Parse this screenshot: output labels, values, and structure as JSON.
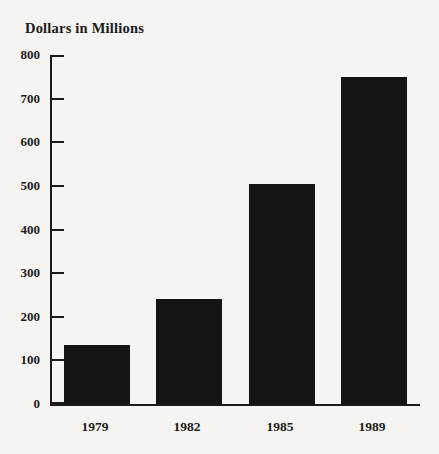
{
  "title": "Dollars in Millions",
  "chart_data": {
    "type": "bar",
    "categories": [
      "1979",
      "1982",
      "1985",
      "1989"
    ],
    "values": [
      135,
      240,
      505,
      750
    ],
    "title": "Dollars in Millions",
    "xlabel": "",
    "ylabel": "Dollars in Millions",
    "ylim": [
      0,
      800
    ],
    "y_ticks": [
      0,
      100,
      200,
      300,
      400,
      500,
      600,
      700,
      800
    ],
    "grid": false,
    "legend": false,
    "bar_color": "#141413",
    "background_color": "#f5f4f1",
    "axis_color": "#1c1b1a",
    "text_color": "#1c1b1a"
  }
}
